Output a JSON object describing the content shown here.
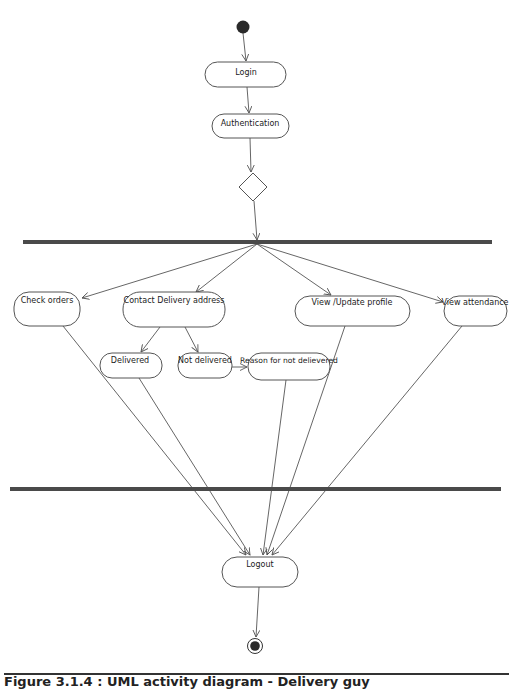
{
  "diagram": {
    "type": "UML activity diagram",
    "start_node": {
      "kind": "initial-node"
    },
    "end_node": {
      "kind": "final-node"
    },
    "nodes": {
      "login": {
        "label": "Login"
      },
      "authentication": {
        "label": "Authentication"
      },
      "decision": {
        "kind": "decision"
      },
      "fork": {
        "kind": "fork-bar"
      },
      "check_orders": {
        "label": "Check orders"
      },
      "contact_delivery": {
        "label": "Contact Delivery address"
      },
      "view_update_profile": {
        "label": "View /Update profile"
      },
      "view_attendance": {
        "label": "View attendance"
      },
      "delivered": {
        "label": "Delivered"
      },
      "not_delivered": {
        "label": "Not delivered"
      },
      "reason_not_delivered": {
        "label": "Reason for not delievered"
      },
      "join": {
        "kind": "join-bar"
      },
      "logout": {
        "label": "Logout"
      }
    },
    "edges": [
      [
        "start",
        "login"
      ],
      [
        "login",
        "authentication"
      ],
      [
        "authentication",
        "decision"
      ],
      [
        "decision",
        "fork"
      ],
      [
        "fork",
        "check_orders"
      ],
      [
        "fork",
        "contact_delivery"
      ],
      [
        "fork",
        "view_update_profile"
      ],
      [
        "fork",
        "view_attendance"
      ],
      [
        "contact_delivery",
        "delivered"
      ],
      [
        "contact_delivery",
        "not_delivered"
      ],
      [
        "not_delivered",
        "reason_not_delivered"
      ],
      [
        "check_orders",
        "logout"
      ],
      [
        "delivered",
        "logout"
      ],
      [
        "reason_not_delivered",
        "logout"
      ],
      [
        "view_update_profile",
        "logout"
      ],
      [
        "view_attendance",
        "logout"
      ],
      [
        "logout",
        "end"
      ]
    ]
  },
  "caption": "Figure 3.1.4 : UML activity diagram - Delivery guy"
}
